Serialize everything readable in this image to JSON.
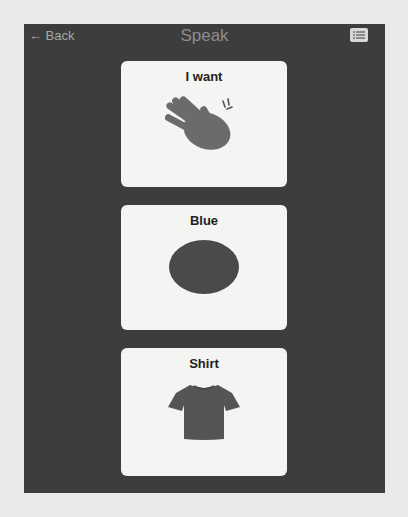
{
  "nav": {
    "back_label": "← Back",
    "title": "Speak",
    "menu_icon": "list-icon"
  },
  "cards": [
    {
      "label": "I want",
      "icon": "hand-icon"
    },
    {
      "label": "Blue",
      "icon": "blue-circle-icon"
    },
    {
      "label": "Shirt",
      "icon": "shirt-icon"
    }
  ],
  "colors": {
    "panel": "#3d3d3d",
    "card": "#f4f4f2",
    "icon_fill": "#6b6b6b"
  }
}
